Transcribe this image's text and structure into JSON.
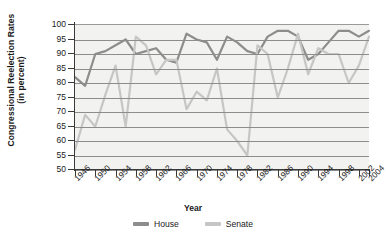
{
  "chart_data": {
    "type": "line",
    "title": "",
    "xlabel": "Year",
    "ylabel": "Congressional Reelection Rates (in percent)",
    "ylabel_line1": "Congressional Reelection Rates",
    "ylabel_line2": "(in percent)",
    "ylim": [
      50,
      100
    ],
    "yticks": [
      50,
      55,
      60,
      65,
      70,
      75,
      80,
      85,
      90,
      95,
      100
    ],
    "ytick_labels": [
      "50",
      "55",
      "60",
      "65",
      "70",
      "75",
      "80",
      "85",
      "90",
      "95",
      "100"
    ],
    "xlim": [
      1946,
      2004
    ],
    "x": [
      1946,
      1948,
      1950,
      1952,
      1954,
      1956,
      1958,
      1960,
      1962,
      1964,
      1966,
      1968,
      1970,
      1972,
      1974,
      1976,
      1978,
      1980,
      1982,
      1984,
      1986,
      1988,
      1990,
      1992,
      1994,
      1996,
      1998,
      2000,
      2002,
      2004
    ],
    "xtick_labels": [
      "1946",
      "1950",
      "1954",
      "1958",
      "1962",
      "1966",
      "1970",
      "1974",
      "1978",
      "1982",
      "1986",
      "1990",
      "1994",
      "1998",
      "2002",
      "2004"
    ],
    "xticks": [
      1946,
      1950,
      1954,
      1958,
      1962,
      1966,
      1970,
      1974,
      1978,
      1982,
      1986,
      1990,
      1994,
      1998,
      2002,
      2004
    ],
    "grid": true,
    "grid_axis": "y",
    "legend_position": "bottom",
    "series": [
      {
        "name": "House",
        "color": "#8d8d8d",
        "values": [
          82,
          79,
          90,
          91,
          93,
          95,
          90,
          91,
          92,
          88,
          87,
          97,
          95,
          94,
          88,
          96,
          94,
          91,
          90,
          96,
          98,
          98,
          96,
          88,
          90,
          94,
          98,
          98,
          96,
          98
        ]
      },
      {
        "name": "Senate",
        "color": "#c6c6c6",
        "values": [
          57,
          69,
          65,
          76,
          86,
          65,
          96,
          93,
          83,
          88,
          88,
          71,
          77,
          74,
          85,
          64,
          60,
          55,
          93,
          90,
          75,
          85,
          97,
          83,
          92,
          90,
          90,
          80,
          86,
          96
        ]
      }
    ]
  },
  "legend": {
    "items": [
      {
        "label": "House",
        "color": "#8d8d8d"
      },
      {
        "label": "Senate",
        "color": "#c6c6c6"
      }
    ]
  }
}
